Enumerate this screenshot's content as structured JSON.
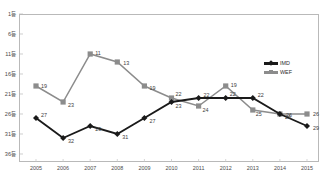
{
  "chart_data": {
    "type": "line",
    "title": "",
    "xlabel": "",
    "ylabel": "",
    "categories": [
      "2005",
      "2006",
      "2007",
      "2008",
      "2009",
      "2010",
      "2011",
      "2012",
      "2013",
      "2014",
      "2015"
    ],
    "y_tick_labels": [
      "1등",
      "6등",
      "11등",
      "16등",
      "21등",
      "26등",
      "31등",
      "36등"
    ],
    "y_tick_values": [
      1,
      6,
      11,
      16,
      21,
      26,
      31,
      36
    ],
    "ylim": [
      1,
      38
    ],
    "y_axis_inverted": true,
    "grid": false,
    "legend_position": "right-top",
    "series": [
      {
        "name": "IMD",
        "color": "#1a1a1a",
        "marker": "diamond",
        "values": [
          27,
          32,
          29,
          31,
          27,
          23,
          22,
          22,
          22,
          26,
          29
        ],
        "labels": [
          "27",
          "32",
          "29",
          "31",
          "27",
          "23",
          "22",
          "22",
          "22",
          "26",
          "29"
        ]
      },
      {
        "name": "WEF",
        "color": "#8c8c8c",
        "marker": "square",
        "values": [
          19,
          23,
          11,
          13,
          19,
          22,
          24,
          19,
          25,
          26,
          26
        ],
        "labels": [
          "19",
          "23",
          "11",
          "13",
          "19",
          "22",
          "24",
          "19",
          "25",
          "26",
          "26"
        ]
      }
    ]
  },
  "legend": {
    "items": [
      {
        "label": "IMD"
      },
      {
        "label": "WEF"
      }
    ]
  }
}
